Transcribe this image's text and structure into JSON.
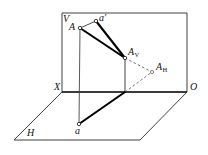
{
  "figure": {
    "type": "descriptive-geometry-diagram",
    "colors": {
      "line": "#1a1a1a",
      "thick_line": "#000000",
      "dashed_line": "#555555",
      "plane_outline": "#333333",
      "background": "#ffffff"
    },
    "labels": {
      "plane_v": "V",
      "plane_h": "H",
      "axis_x": "X",
      "origin_o": "O",
      "point_A": "A",
      "point_a_prime": "a′",
      "point_a": "a",
      "point_Av_base": "A",
      "point_Av_sub": "V",
      "point_Ah_base": "A",
      "point_Ah_sub": "H"
    },
    "points": {
      "A": {
        "x": 80,
        "y": 28,
        "label": "A"
      },
      "a_prime": {
        "x": 96,
        "y": 21,
        "label": "a′"
      },
      "A_V": {
        "x": 125,
        "y": 58,
        "label": "AV"
      },
      "A_H": {
        "x": 152,
        "y": 72,
        "label": "AH"
      },
      "a": {
        "x": 79,
        "y": 124,
        "label": "a"
      },
      "foot": {
        "x": 125,
        "y": 92,
        "label": ""
      },
      "X": {
        "x": 62,
        "y": 92,
        "label": "X"
      },
      "O": {
        "x": 187,
        "y": 92,
        "label": "O"
      }
    },
    "plane_v_rect": {
      "left": 62,
      "top": 13,
      "right": 187,
      "bottom": 92
    },
    "plane_h_quad": {
      "p1x": 62,
      "p1y": 92,
      "p2x": 187,
      "p2y": 92,
      "p3x": 140,
      "p3y": 140,
      "p4x": 14,
      "p4y": 140
    }
  }
}
